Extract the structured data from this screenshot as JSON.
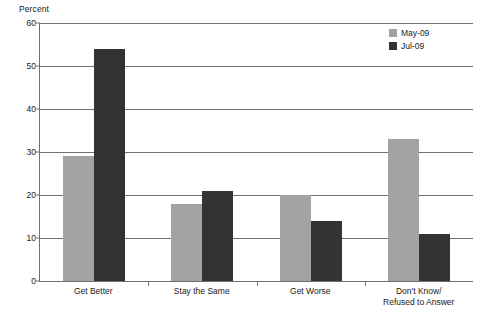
{
  "chart_data": {
    "type": "bar",
    "title": "",
    "subtitle": "",
    "xlabel": "",
    "ylabel": "Percent",
    "ylim": [
      0,
      60
    ],
    "yticks": [
      0,
      10,
      20,
      30,
      40,
      50,
      60
    ],
    "ytick_labels": [
      "0",
      "10",
      "20",
      "30",
      "40",
      "50",
      "60"
    ],
    "grid": true,
    "legend_position": "top-right",
    "categories": [
      "Get Better",
      "Stay the Same",
      "Get Worse",
      "Don't Know/Refused to Answer"
    ],
    "category_lines": [
      [
        "Get Better"
      ],
      [
        "Stay the Same"
      ],
      [
        "Get Worse"
      ],
      [
        "Don't Know/",
        "Refused to Answer"
      ]
    ],
    "series": [
      {
        "name": "May-09",
        "color": "#a3a3a3",
        "values": [
          29,
          18,
          20,
          33
        ]
      },
      {
        "name": "Jul-09",
        "color": "#333333",
        "values": [
          54,
          21,
          14,
          11
        ]
      }
    ]
  },
  "legend": {
    "items": [
      {
        "label": "May-09",
        "swatch": "legend-swatch-may-09"
      },
      {
        "label": "Jul-09",
        "swatch": "legend-swatch-jul-09"
      }
    ]
  },
  "axis": {
    "y_title": "Percent"
  },
  "colors": {
    "series_may_09": "#a3a3a3",
    "series_jul_09": "#333333",
    "axis": "#6f6f6f",
    "text": "#1a1a1a",
    "background": "#ffffff"
  }
}
